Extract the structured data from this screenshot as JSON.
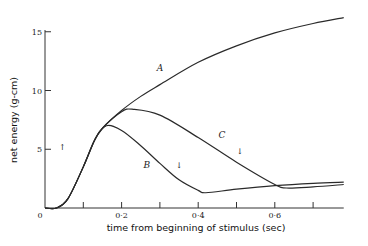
{
  "chart_data": {
    "type": "line",
    "title": "",
    "xlabel": "time from beginning of stimulus (sec)",
    "ylabel": "net energy (g-cm)",
    "xlim": [
      0,
      0.78
    ],
    "ylim": [
      0,
      17
    ],
    "grid": false,
    "legend": "none (curves labelled inline A, B, C)",
    "x_ticks": [
      0,
      0.1,
      0.2,
      0.3,
      0.4,
      0.5,
      0.6,
      0.7
    ],
    "x_tick_labels": [
      "0",
      "",
      "0·2",
      "",
      "0·4",
      "",
      "0·6",
      ""
    ],
    "y_ticks": [
      0,
      5,
      10,
      15
    ],
    "y_tick_labels": [
      "0",
      "5",
      "10",
      "15"
    ],
    "series": [
      {
        "name": "A",
        "x": [
          0,
          0.03,
          0.06,
          0.1,
          0.13,
          0.15,
          0.2,
          0.25,
          0.3,
          0.4,
          0.5,
          0.6,
          0.7,
          0.78
        ],
        "values": [
          0,
          0,
          0.8,
          3.5,
          5.8,
          6.8,
          8.3,
          9.5,
          10.5,
          12.4,
          13.8,
          14.9,
          15.7,
          16.2
        ]
      },
      {
        "name": "B",
        "x": [
          0,
          0.03,
          0.06,
          0.1,
          0.13,
          0.16,
          0.2,
          0.25,
          0.3,
          0.35,
          0.4,
          0.42,
          0.5,
          0.6,
          0.7,
          0.78
        ],
        "values": [
          0,
          0,
          0.8,
          3.5,
          5.8,
          7.0,
          6.6,
          5.3,
          3.8,
          2.4,
          1.5,
          1.3,
          1.6,
          1.9,
          2.1,
          2.2
        ]
      },
      {
        "name": "C",
        "x": [
          0,
          0.03,
          0.06,
          0.1,
          0.13,
          0.15,
          0.2,
          0.23,
          0.3,
          0.4,
          0.5,
          0.6,
          0.63,
          0.7,
          0.78
        ],
        "values": [
          0,
          0,
          0.8,
          3.5,
          5.8,
          6.8,
          8.2,
          8.4,
          7.9,
          6.0,
          3.9,
          2.0,
          1.7,
          1.8,
          2.0
        ]
      }
    ],
    "annotations": [
      {
        "text": "A",
        "x": 0.3,
        "y": 11.7
      },
      {
        "text": "B",
        "x": 0.266,
        "y": 3.4
      },
      {
        "text": "C",
        "x": 0.462,
        "y": 6.0
      },
      {
        "text": "↑",
        "x": 0.045,
        "y": 4.9
      },
      {
        "text": "↓",
        "x": 0.35,
        "y": 3.4
      },
      {
        "text": "↓",
        "x": 0.509,
        "y": 4.6
      }
    ]
  },
  "axes": {
    "x_title": "time from beginning of stimulus (sec)",
    "y_title": "net energy (g-cm)",
    "origin_label": "0"
  }
}
